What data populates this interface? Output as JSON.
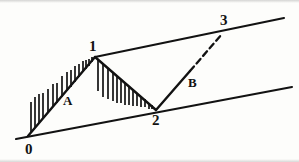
{
  "figure": {
    "type": "elliott-wave-channel-diagram",
    "background_color": "#fdfdfb",
    "ink_color": "#121212",
    "width": 299,
    "height": 162
  },
  "labels": {
    "point_0": "0",
    "point_1": "1",
    "point_2": "2",
    "point_3": "3",
    "wave_a": "A",
    "wave_b": "B"
  },
  "points": {
    "p0": {
      "x": 28,
      "y": 136
    },
    "p1": {
      "x": 95,
      "y": 57
    },
    "p2": {
      "x": 156,
      "y": 110
    },
    "p3": {
      "x": 222,
      "y": 33
    }
  },
  "label_positions": {
    "point_0": {
      "x": 25,
      "y": 142
    },
    "point_1": {
      "x": 89,
      "y": 39
    },
    "point_2": {
      "x": 152,
      "y": 113
    },
    "point_3": {
      "x": 220,
      "y": 13
    },
    "wave_a": {
      "x": 63,
      "y": 94
    },
    "wave_b": {
      "x": 188,
      "y": 76
    }
  },
  "channel_lines": [
    {
      "name": "upper-trendline",
      "x1": 95,
      "y1": 57,
      "x2": 284,
      "y2": 18,
      "style": "solid",
      "width": 2.1
    },
    {
      "name": "lower-trendline",
      "x1": 16,
      "y1": 139,
      "x2": 292,
      "y2": 87,
      "style": "solid",
      "width": 2.1
    }
  ],
  "price_path": [
    {
      "name": "wave-0-to-1-advance",
      "x1": 28,
      "y1": 136,
      "x2": 95,
      "y2": 57,
      "style": "solid",
      "width": 2.4
    },
    {
      "name": "wave-1-to-2-decline",
      "x1": 95,
      "y1": 57,
      "x2": 156,
      "y2": 110,
      "style": "solid",
      "width": 2.4
    },
    {
      "name": "wave-2-to-3-solid-part",
      "x1": 156,
      "y1": 110,
      "x2": 190,
      "y2": 71,
      "style": "solid",
      "width": 2.4
    },
    {
      "name": "wave-2-to-3-dashed-part",
      "x1": 190,
      "y1": 71,
      "x2": 222,
      "y2": 34,
      "style": "dashed",
      "width": 2.3,
      "dash_pattern": "6,4"
    }
  ],
  "hatching": {
    "wave_a_ticks": {
      "direction": "up",
      "description": "vertical tick marks rising above the 0-1 advance line",
      "marks": [
        {
          "x": 31,
          "base_y": 132,
          "length": 30
        },
        {
          "x": 35,
          "base_y": 128,
          "length": 31
        },
        {
          "x": 39,
          "base_y": 123,
          "length": 29
        },
        {
          "x": 43,
          "base_y": 118,
          "length": 25
        },
        {
          "x": 48,
          "base_y": 113,
          "length": 24
        },
        {
          "x": 53,
          "base_y": 107,
          "length": 23
        },
        {
          "x": 57,
          "base_y": 103,
          "length": 20
        },
        {
          "x": 62,
          "base_y": 97,
          "length": 21
        },
        {
          "x": 67,
          "base_y": 91,
          "length": 19
        },
        {
          "x": 71,
          "base_y": 87,
          "length": 17
        },
        {
          "x": 75,
          "base_y": 82,
          "length": 16
        },
        {
          "x": 79,
          "base_y": 77,
          "length": 13
        },
        {
          "x": 83,
          "base_y": 72,
          "length": 11
        },
        {
          "x": 86,
          "base_y": 69,
          "length": 9
        },
        {
          "x": 89,
          "base_y": 66,
          "length": 7
        },
        {
          "x": 92,
          "base_y": 62,
          "length": 5
        }
      ]
    },
    "wave_1_2_ticks": {
      "direction": "down",
      "description": "vertical tick marks hanging below the 1-2 decline line",
      "marks": [
        {
          "x": 98,
          "base_y": 60,
          "length": 31
        },
        {
          "x": 103,
          "base_y": 64,
          "length": 33
        },
        {
          "x": 108,
          "base_y": 68,
          "length": 31
        },
        {
          "x": 113,
          "base_y": 73,
          "length": 28
        },
        {
          "x": 117,
          "base_y": 76,
          "length": 27
        },
        {
          "x": 121,
          "base_y": 79,
          "length": 24
        },
        {
          "x": 125,
          "base_y": 83,
          "length": 22
        },
        {
          "x": 129,
          "base_y": 86,
          "length": 19
        },
        {
          "x": 133,
          "base_y": 89,
          "length": 17
        },
        {
          "x": 137,
          "base_y": 93,
          "length": 13
        },
        {
          "x": 141,
          "base_y": 96,
          "length": 11
        },
        {
          "x": 145,
          "base_y": 99,
          "length": 8
        },
        {
          "x": 149,
          "base_y": 103,
          "length": 6
        },
        {
          "x": 152,
          "base_y": 105,
          "length": 4
        }
      ]
    }
  }
}
